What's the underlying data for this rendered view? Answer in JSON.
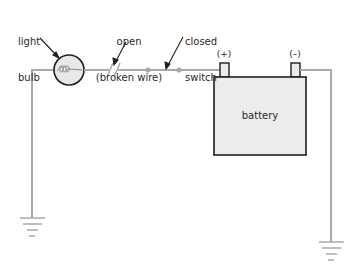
{
  "diagram": {
    "labels": {
      "light_bulb": [
        "light",
        "bulb"
      ],
      "open": [
        "open",
        "(broken wire)"
      ],
      "closed_switch": [
        "closed",
        "switch"
      ],
      "positive_terminal": "(+)",
      "negative_terminal": "(–)",
      "battery": "battery"
    },
    "colors": {
      "wire": "#a9a9a9",
      "bulb_fill": "#e8e8e8",
      "battery_fill": "#ececec",
      "outline": "#1e1e1e",
      "text": "#2a2a2a"
    }
  }
}
